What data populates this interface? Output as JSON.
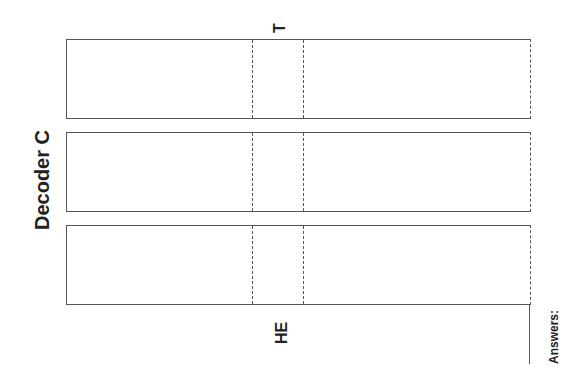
{
  "diagram": {
    "title": "Decoder C",
    "top_label": "T",
    "bottom_label": "HE",
    "answers_label": "Answers:",
    "strips": [
      {
        "id": 1,
        "top": 39,
        "height": 80
      },
      {
        "id": 2,
        "top": 132,
        "height": 80
      },
      {
        "id": 3,
        "top": 225,
        "height": 80
      }
    ],
    "dashed_columns_x": [
      252,
      303
    ],
    "line_color": "#555555"
  }
}
